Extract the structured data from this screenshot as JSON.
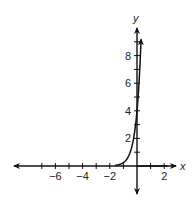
{
  "chart_data": {
    "type": "line",
    "title": "",
    "xlabel": "x",
    "ylabel": "y",
    "xlim": [
      -8.5,
      2.6
    ],
    "ylim": [
      -1.5,
      9.8
    ],
    "grid": false,
    "x_ticks": [
      -7,
      -6,
      -5,
      -4,
      -3,
      -2,
      -1,
      1,
      2
    ],
    "x_tick_labels": [
      {
        "value": -6,
        "label": "−6"
      },
      {
        "value": -4,
        "label": "−4"
      },
      {
        "value": -2,
        "label": "−2"
      },
      {
        "value": 2,
        "label": "2"
      }
    ],
    "y_ticks": [
      1,
      2,
      3,
      4,
      5,
      6,
      7,
      8,
      9
    ],
    "y_tick_labels": [
      {
        "value": 2,
        "label": "2"
      },
      {
        "value": 4,
        "label": "4"
      },
      {
        "value": 6,
        "label": "6"
      },
      {
        "value": 8,
        "label": "8"
      }
    ],
    "series": [
      {
        "name": "exponential curve",
        "x": [
          -1.6,
          -1.4,
          -1.2,
          -1.0,
          -0.8,
          -0.6,
          -0.4,
          -0.2,
          0.0,
          0.1,
          0.2,
          0.3
        ],
        "y": [
          0.05,
          0.08,
          0.14,
          0.25,
          0.44,
          0.76,
          1.32,
          2.3,
          4.0,
          5.3,
          7.0,
          9.6
        ]
      }
    ],
    "legend": null
  },
  "labels": {
    "x_axis": "x",
    "y_axis": "y"
  }
}
